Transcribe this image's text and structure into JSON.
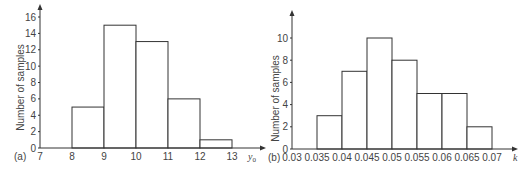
{
  "chart_data": [
    {
      "type": "bar",
      "panel_label": "(a)",
      "title": "",
      "xlabel": "y0",
      "xlabel_display": "y",
      "xlabel_sub": "0",
      "ylabel": "Number of samples",
      "x_ticks": [
        "7",
        "8",
        "9",
        "10",
        "11",
        "12",
        "13"
      ],
      "y_ticks": [
        "0",
        "2",
        "4",
        "6",
        "8",
        "10",
        "12",
        "14",
        "16"
      ],
      "xlim": [
        7,
        13
      ],
      "ylim": [
        0,
        16
      ],
      "bins": [
        [
          8,
          9
        ],
        [
          9,
          10
        ],
        [
          10,
          11
        ],
        [
          11,
          12
        ],
        [
          12,
          13
        ]
      ],
      "categories": [
        "8-9",
        "9-10",
        "10-11",
        "11-12",
        "12-13"
      ],
      "values": [
        5,
        15,
        13,
        6,
        1
      ],
      "grid": false
    },
    {
      "type": "bar",
      "panel_label": "(b)",
      "title": "",
      "xlabel": "k",
      "ylabel": "Number of samples",
      "x_ticks": [
        "0.03",
        "0.035",
        "0.04",
        "0.045",
        "0.05",
        "0.055",
        "0.06",
        "0.065",
        "0.07"
      ],
      "y_ticks": [
        "0",
        "2",
        "4",
        "6",
        "8",
        "10"
      ],
      "xlim": [
        0.03,
        0.07
      ],
      "ylim": [
        0,
        10
      ],
      "bins": [
        [
          0.035,
          0.04
        ],
        [
          0.04,
          0.045
        ],
        [
          0.045,
          0.05
        ],
        [
          0.05,
          0.055
        ],
        [
          0.055,
          0.06
        ],
        [
          0.06,
          0.065
        ],
        [
          0.065,
          0.07
        ]
      ],
      "categories": [
        "0.035-0.04",
        "0.04-0.045",
        "0.045-0.05",
        "0.05-0.055",
        "0.055-0.06",
        "0.06-0.065",
        "0.065-0.07"
      ],
      "values": [
        3,
        7,
        10,
        8,
        5,
        5,
        2
      ],
      "grid": false
    }
  ]
}
